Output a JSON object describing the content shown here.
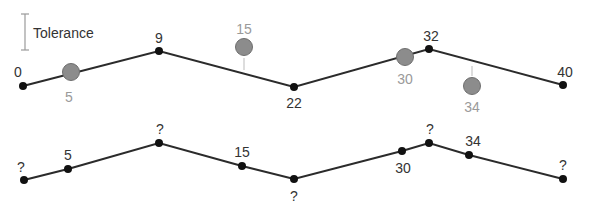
{
  "legend": {
    "label": "Tolerance",
    "color": "#9a9a9a"
  },
  "colors": {
    "line": "#2b2b2b",
    "vertex": "#111111",
    "removed_point": "#8c8c8c",
    "removed_label": "#9a9a9a",
    "label": "#333333"
  },
  "top": {
    "vertices": [
      {
        "label": "0",
        "x": 23,
        "y": 86,
        "lx": 18,
        "ly": 77
      },
      {
        "label": "9",
        "x": 159,
        "y": 51,
        "lx": 159,
        "ly": 43
      },
      {
        "label": "22",
        "x": 294,
        "y": 87,
        "lx": 294,
        "ly": 108
      },
      {
        "label": "32",
        "x": 429,
        "y": 49,
        "lx": 431,
        "ly": 41
      },
      {
        "label": "40",
        "x": 563,
        "y": 85,
        "lx": 565,
        "ly": 77
      }
    ],
    "removed": [
      {
        "label": "5",
        "x": 71,
        "y": 72,
        "lx": 69,
        "ly": 102
      },
      {
        "label": "15",
        "x": 244,
        "y": 47,
        "lx": 244,
        "ly": 34,
        "stem": [
          244,
          58,
          244,
          70
        ]
      },
      {
        "label": "30",
        "x": 405,
        "y": 57,
        "lx": 405,
        "ly": 84
      },
      {
        "label": "34",
        "x": 472,
        "y": 86,
        "lx": 472,
        "ly": 112,
        "stem": [
          472,
          66,
          472,
          76
        ]
      }
    ]
  },
  "bottom": {
    "vertices": [
      {
        "label": "?",
        "x": 24,
        "y": 180,
        "lx": 21,
        "ly": 172
      },
      {
        "label": "5",
        "x": 68,
        "y": 169,
        "lx": 68,
        "ly": 160
      },
      {
        "label": "?",
        "x": 159,
        "y": 143,
        "lx": 160,
        "ly": 134
      },
      {
        "label": "15",
        "x": 242,
        "y": 166,
        "lx": 242,
        "ly": 157
      },
      {
        "label": "?",
        "x": 294,
        "y": 179,
        "lx": 294,
        "ly": 201
      },
      {
        "label": "30",
        "x": 402,
        "y": 151,
        "lx": 403,
        "ly": 173
      },
      {
        "label": "?",
        "x": 429,
        "y": 143,
        "lx": 430,
        "ly": 134
      },
      {
        "label": "34",
        "x": 469,
        "y": 155,
        "lx": 473,
        "ly": 146
      },
      {
        "label": "?",
        "x": 563,
        "y": 179,
        "lx": 563,
        "ly": 170
      }
    ]
  }
}
